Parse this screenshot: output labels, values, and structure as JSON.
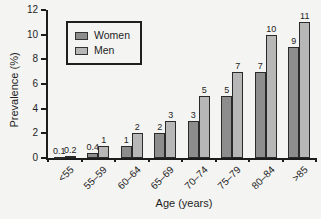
{
  "chart_data": {
    "type": "bar",
    "categories": [
      "<55",
      "55–59",
      "60–64",
      "65–69",
      "70–74",
      "75–79",
      "80–84",
      ">85"
    ],
    "series": [
      {
        "name": "Women",
        "color": "#8d8d8d",
        "values": [
          0.1,
          0.4,
          1,
          2,
          3,
          5,
          7,
          9
        ]
      },
      {
        "name": "Men",
        "color": "#b7b7b7",
        "values": [
          0.2,
          1,
          2,
          3,
          5,
          7,
          10,
          11
        ]
      }
    ],
    "title": "",
    "xlabel": "Age (years)",
    "ylabel": "Prevalence (%)",
    "ylim": [
      0,
      12
    ],
    "ytick_step": 2,
    "grid": false,
    "value_labels": true,
    "legend_position": "upper-left-inside"
  },
  "colors": {
    "axis": "#1c1c1c",
    "background": "#f4f4f2",
    "bar_outline": "#2a2a2a",
    "text": "#1e1e1e"
  }
}
